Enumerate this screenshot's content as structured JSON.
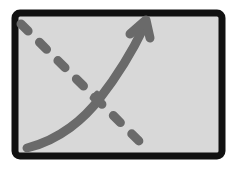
{
  "icon": {
    "name": "trend-chart-icon",
    "description": "Chart icon with a descending dashed line and an ascending curved arrow",
    "colors": {
      "background": "#ffffff",
      "frame_fill": "#d8d8d8",
      "frame_border": "#111111",
      "line": "#6a6a6a"
    }
  }
}
